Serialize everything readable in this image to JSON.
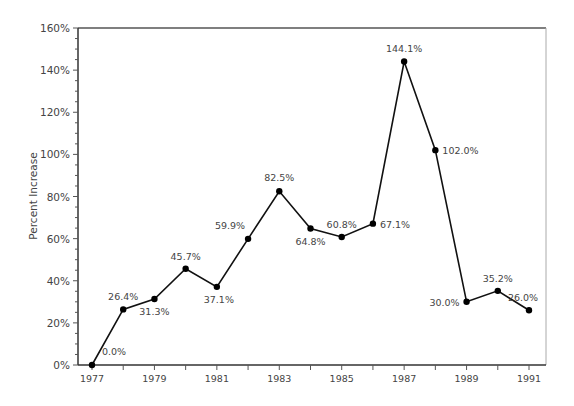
{
  "chart_data": {
    "type": "line",
    "title": "",
    "xlabel": "",
    "ylabel": "Percent Increase",
    "x": [
      1977,
      1978,
      1979,
      1980,
      1981,
      1982,
      1983,
      1984,
      1985,
      1986,
      1987,
      1988,
      1989,
      1990,
      1991
    ],
    "series": [
      {
        "name": "Percent Increase",
        "values": [
          0.0,
          26.4,
          31.3,
          45.7,
          37.1,
          59.9,
          82.5,
          64.8,
          60.8,
          67.1,
          144.1,
          102.0,
          30.0,
          35.2,
          26.0
        ],
        "labels": [
          "0.0%",
          "26.4%",
          "31.3%",
          "45.7%",
          "37.1%",
          "59.9%",
          "82.5%",
          "64.8%",
          "60.8%",
          "67.1%",
          "144.1%",
          "102.0%",
          "30.0%",
          "35.2%",
          "26.0%"
        ],
        "color": "#111111"
      }
    ],
    "x_tick_labels": [
      "1977",
      "1979",
      "1981",
      "1983",
      "1985",
      "1987",
      "1989",
      "1991"
    ],
    "y_ticks": [
      0,
      20,
      40,
      60,
      80,
      100,
      120,
      140,
      160
    ],
    "y_tick_labels": [
      "0%",
      "20%",
      "40%",
      "60%",
      "80%",
      "100%",
      "120%",
      "140%",
      "160%"
    ],
    "ylim": [
      0,
      160
    ],
    "xlim": [
      1976.5,
      1991.5
    ],
    "grid": false,
    "legend": "none"
  }
}
